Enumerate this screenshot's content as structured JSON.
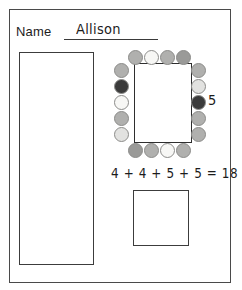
{
  "worksheet": {
    "name_label": "Name",
    "name_value": "Allison",
    "side_count": "5",
    "equation": "4 + 4 + 5 + 5 = 18"
  },
  "palette": {
    "ink": "#1c1c1c",
    "frame": "#4a4a4a",
    "box_border": "#3c3c3c",
    "counter_white": "#f7f7f5",
    "counter_light": "#e2e2e0",
    "counter_medium": "#b0b0ae",
    "counter_mediumdark": "#9a9a98",
    "counter_dark": "#3b3b3b",
    "counter_outline": "#8c8c8a"
  },
  "array": {
    "rows": 5,
    "cols": 4,
    "total_counters": 18,
    "top_row": [
      {
        "index": 0,
        "shade": "medium",
        "fill": "#b0b0ae",
        "x": 18,
        "y": 0
      },
      {
        "index": 1,
        "shade": "white",
        "fill": "#f7f7f5",
        "x": 34,
        "y": 0
      },
      {
        "index": 2,
        "shade": "medium",
        "fill": "#b0b0ae",
        "x": 50,
        "y": 0
      },
      {
        "index": 3,
        "shade": "mediumdark",
        "fill": "#9a9a98",
        "x": 66,
        "y": 0
      }
    ],
    "left_col": [
      {
        "index": 0,
        "shade": "medium",
        "fill": "#b0b0ae",
        "x": 4,
        "y": 13
      },
      {
        "index": 1,
        "shade": "dark",
        "fill": "#3b3b3b",
        "x": 4,
        "y": 29
      },
      {
        "index": 2,
        "shade": "white",
        "fill": "#f7f7f5",
        "x": 4,
        "y": 45
      },
      {
        "index": 3,
        "shade": "medium",
        "fill": "#b0b0ae",
        "x": 4,
        "y": 61
      },
      {
        "index": 4,
        "shade": "light",
        "fill": "#e2e2e0",
        "x": 4,
        "y": 77
      }
    ],
    "right_col": [
      {
        "index": 0,
        "shade": "medium",
        "fill": "#b0b0ae",
        "x": 81,
        "y": 13
      },
      {
        "index": 1,
        "shade": "light",
        "fill": "#e2e2e0",
        "x": 81,
        "y": 29
      },
      {
        "index": 2,
        "shade": "dark",
        "fill": "#3b3b3b",
        "x": 81,
        "y": 45
      },
      {
        "index": 3,
        "shade": "medium",
        "fill": "#b0b0ae",
        "x": 81,
        "y": 61
      },
      {
        "index": 4,
        "shade": "medium",
        "fill": "#b0b0ae",
        "x": 81,
        "y": 77
      }
    ],
    "bottom_row": [
      {
        "index": 0,
        "shade": "mediumdark",
        "fill": "#9a9a98",
        "x": 18,
        "y": 93
      },
      {
        "index": 1,
        "shade": "medium",
        "fill": "#b0b0ae",
        "x": 34,
        "y": 93
      },
      {
        "index": 2,
        "shade": "white",
        "fill": "#f7f7f5",
        "x": 50,
        "y": 93
      },
      {
        "index": 3,
        "shade": "medium",
        "fill": "#b0b0ae",
        "x": 66,
        "y": 93
      }
    ]
  }
}
